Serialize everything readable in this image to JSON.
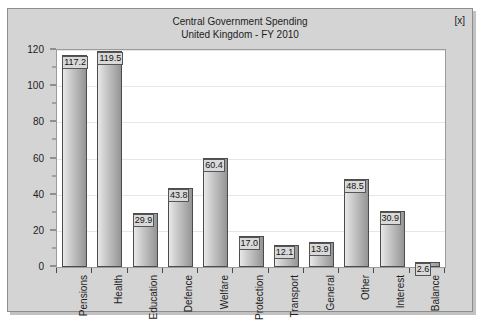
{
  "window": {
    "close_label": "[x]"
  },
  "chart_data": {
    "type": "bar",
    "title": "Central Government Spending",
    "subtitle": "United Kingdom - FY 2010",
    "title_lines": [
      "Central Government Spending",
      "United Kingdom - FY 2010"
    ],
    "xlabel": "",
    "ylabel": "£ billion",
    "ylim": [
      0,
      120
    ],
    "ytick_step": 20,
    "yticks": [
      0,
      20,
      40,
      60,
      80,
      100,
      120
    ],
    "ytick_labels": [
      "0",
      "20",
      "40",
      "60",
      "80",
      "100",
      "120"
    ],
    "yminor_step": 10,
    "grid": true,
    "legend": false,
    "categories": [
      "Pensions",
      "Health",
      "Education",
      "Defence",
      "Welfare",
      "Protection",
      "Transport",
      "General",
      "Other",
      "Interest",
      "Balance"
    ],
    "values": [
      117.2,
      119.5,
      29.9,
      43.8,
      60.4,
      17.0,
      12.1,
      13.9,
      48.5,
      30.9,
      2.6
    ],
    "value_labels": [
      "117.2",
      "119.5",
      "29.9",
      "43.8",
      "60.4",
      "17.0",
      "12.1",
      "13.9",
      "48.5",
      "30.9",
      "2.6"
    ],
    "colors": {
      "bar_light": "#e8e8e8",
      "bar_dark": "#949494",
      "bar_outline": "#4c4c4c",
      "plot_background": "#ffffff",
      "window_background": "#d4d4d4",
      "gridline": "#e6e6e6",
      "text": "#1d1d1d"
    }
  }
}
